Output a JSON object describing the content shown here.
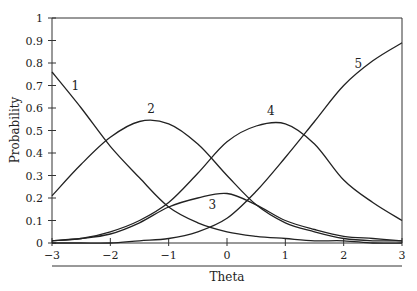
{
  "chart_data": {
    "type": "line",
    "title": "",
    "xlabel": "Theta",
    "ylabel": "Probability",
    "xlim": [
      -3,
      3
    ],
    "ylim": [
      0,
      1
    ],
    "grid": false,
    "legend": "inline curve labels",
    "x_ticks": [
      -3,
      -2,
      -1,
      0,
      1,
      2,
      3
    ],
    "x_tick_labels": [
      "−3",
      "−2",
      "−1",
      "0",
      "1",
      "2",
      "3"
    ],
    "y_ticks": [
      0,
      0.1,
      0.2,
      0.3,
      0.4,
      0.5,
      0.6,
      0.7,
      0.8,
      0.9,
      1
    ],
    "y_tick_labels": [
      "0",
      "0.1",
      "0.2",
      "0.3",
      "0.4",
      "0.5",
      "0.6",
      "0.7",
      "0.8",
      "0.9",
      "1"
    ],
    "x": [
      -3,
      -2.5,
      -2,
      -1.5,
      -1,
      -0.5,
      0,
      0.5,
      1,
      1.5,
      2,
      2.5,
      3
    ],
    "series": [
      {
        "name": "1",
        "label_pos": [
          -2.6,
          0.68
        ],
        "values": [
          0.76,
          0.6,
          0.43,
          0.29,
          0.16,
          0.09,
          0.05,
          0.03,
          0.02,
          0.01,
          0.01,
          0.0,
          0.0
        ]
      },
      {
        "name": "2",
        "label_pos": [
          -1.3,
          0.58
        ],
        "values": [
          0.21,
          0.35,
          0.47,
          0.54,
          0.53,
          0.44,
          0.3,
          0.17,
          0.09,
          0.05,
          0.02,
          0.01,
          0.01
        ]
      },
      {
        "name": "3",
        "label_pos": [
          -0.25,
          0.15
        ],
        "values": [
          0.01,
          0.02,
          0.04,
          0.09,
          0.16,
          0.2,
          0.22,
          0.17,
          0.1,
          0.06,
          0.03,
          0.02,
          0.01
        ]
      },
      {
        "name": "4",
        "label_pos": [
          0.75,
          0.57
        ],
        "values": [
          0.01,
          0.02,
          0.05,
          0.1,
          0.18,
          0.31,
          0.45,
          0.52,
          0.53,
          0.44,
          0.28,
          0.18,
          0.1
        ]
      },
      {
        "name": "5",
        "label_pos": [
          2.25,
          0.78
        ],
        "values": [
          0.0,
          0.0,
          0.0,
          0.01,
          0.02,
          0.05,
          0.11,
          0.23,
          0.38,
          0.54,
          0.7,
          0.81,
          0.89
        ]
      }
    ]
  },
  "colors": {
    "line": "#222222",
    "axis": "#333333",
    "background": "#ffffff"
  }
}
